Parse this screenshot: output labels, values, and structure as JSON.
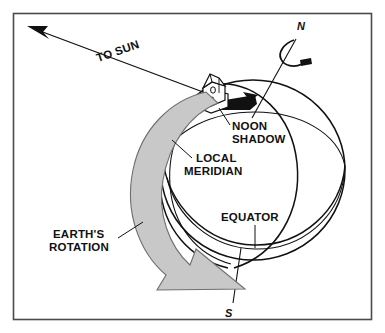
{
  "figure": {
    "background_color": "#ffffff",
    "line_color": "#111111",
    "frame_color": "#4a4a4a",
    "arrow_fill_color": "#c8c8c8",
    "shadow_fill_color": "#111111"
  },
  "labels": {
    "to_sun": "TO SUN",
    "north_pole": "N",
    "south_pole": "S",
    "noon_shadow_line1": "NOON",
    "noon_shadow_line2": "SHADOW",
    "local_meridian_line1": "LOCAL",
    "local_meridian_line2": "MERIDIAN",
    "equator": "EQUATOR",
    "earths_rotation_line1": "EARTH'S",
    "earths_rotation_line2": "ROTATION"
  },
  "icons": {
    "sun_arrow": "arrow-to-sun-icon",
    "rotation_arrow": "earth-rotation-arrow-icon",
    "axis_spin_arrow": "axis-spin-arrow-icon",
    "house": "house-icon",
    "shadow": "noon-shadow-icon",
    "globe": "globe-icon"
  }
}
